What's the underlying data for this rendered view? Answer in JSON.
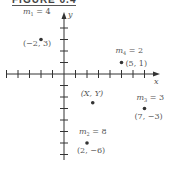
{
  "figure_title": "FIGURE 6.4",
  "axes": {
    "x_label": "x",
    "y_label": "y"
  },
  "points": [
    {
      "mass_label": "m",
      "sub": "1",
      "mass": "4",
      "coord": "(−2, 3)",
      "x": -2,
      "y": 3
    },
    {
      "mass_label": "m",
      "sub": "4",
      "mass": "2",
      "coord": "(5, 1)",
      "x": 5,
      "y": 1
    },
    {
      "mass_label": "m",
      "sub": "3",
      "mass": "3",
      "coord": "(7, −3)",
      "x": 7,
      "y": -3
    },
    {
      "mass_label": "m",
      "sub": "2",
      "mass": "8",
      "coord": "(2, −6)",
      "x": 2,
      "y": -6
    }
  ],
  "center": {
    "label": "(X, Y)",
    "x": 2.5,
    "y": -2.5
  }
}
